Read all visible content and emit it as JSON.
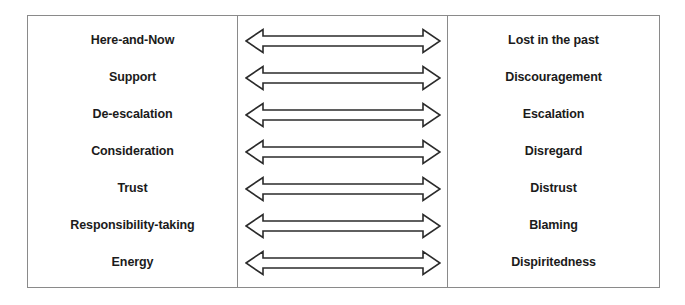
{
  "diagram": {
    "type": "polarity-continuum-table",
    "columns": {
      "left_header": "",
      "middle_header": "",
      "right_header": ""
    },
    "arrow_icon_name": "double-headed-arrow-icon",
    "colors": {
      "frame_border": "#8a8a8a",
      "divider": "#8a8a8a",
      "arrow_stroke": "#2b2b2b",
      "arrow_fill": "#ffffff",
      "text": "#1b1b1b",
      "background": "#ffffff"
    },
    "rows": [
      {
        "left": "Here-and-Now",
        "right": "Lost in the past"
      },
      {
        "left": "Support",
        "right": "Discouragement"
      },
      {
        "left": "De-escalation",
        "right": "Escalation"
      },
      {
        "left": "Consideration",
        "right": "Disregard"
      },
      {
        "left": "Trust",
        "right": "Distrust"
      },
      {
        "left": "Responsibility-taking",
        "right": "Blaming"
      },
      {
        "left": "Energy",
        "right": "Dispiritedness"
      }
    ]
  }
}
